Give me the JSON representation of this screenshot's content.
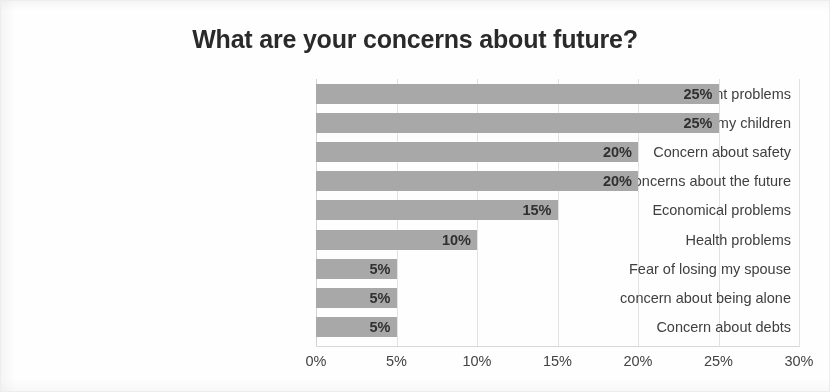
{
  "chart_data": {
    "type": "bar",
    "orientation": "horizontal",
    "title": "What are your concerns about future?",
    "xlabel": "",
    "ylabel": "",
    "categories": [
      "Unemployment problems",
      "Concern about the future of my children",
      "Concern about safety",
      "I have no concerns about the future",
      "Economical problems",
      "Health problems",
      "Fear of losing my spouse",
      "concern about being alone",
      "Concern about debts"
    ],
    "values": [
      25,
      25,
      20,
      20,
      15,
      10,
      5,
      5,
      5
    ],
    "value_labels": [
      "25%",
      "25%",
      "20%",
      "20%",
      "15%",
      "10%",
      "5%",
      "5%",
      "5%"
    ],
    "xlim": [
      0,
      30
    ],
    "xticks": [
      0,
      5,
      10,
      15,
      20,
      25,
      30
    ],
    "xtick_labels": [
      "0%",
      "5%",
      "10%",
      "15%",
      "20%",
      "25%",
      "30%"
    ],
    "grid": true,
    "legend": false,
    "bar_color": "#a8a8a8",
    "text_color": "#404040",
    "title_color": "#2a2a2a",
    "background_color": "#fefefe"
  }
}
